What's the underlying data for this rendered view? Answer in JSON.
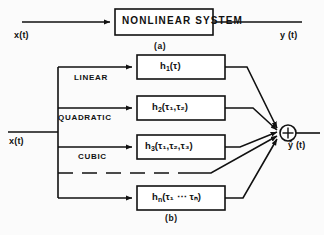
{
  "figure": {
    "panels": [
      {
        "id": "a",
        "caption": "(a)",
        "input_label": "x(t)",
        "output_label": "y (t)",
        "block_label": "NONLINEAR SYSTEM"
      },
      {
        "id": "b",
        "caption": "(b)",
        "input_label": "x(t)",
        "output_label": "ŷ (t)",
        "summing_junction": "+",
        "branches": [
          {
            "order_label": "LINEAR",
            "kernel": "h",
            "kernel_sub": "1",
            "args": "(τ)"
          },
          {
            "order_label": "QUADRATIC",
            "kernel": "h",
            "kernel_sub": "2",
            "args": "(τ₁,τ₂)"
          },
          {
            "order_label": "CUBIC",
            "kernel": "h",
            "kernel_sub": "3",
            "args": "(τ₁,τ₂,τ₃)"
          },
          {
            "order_label": "",
            "kernel": "h",
            "kernel_sub": "n",
            "args": "(τ₁ ⋯ τₙ)"
          }
        ]
      }
    ],
    "colors": {
      "ink": "#111111",
      "paper": "#fbfbfb",
      "box_fill": "#ffffff"
    }
  }
}
